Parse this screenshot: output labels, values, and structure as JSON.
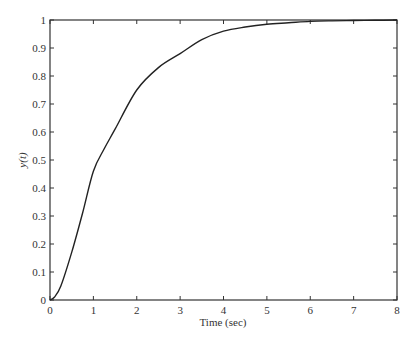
{
  "chart_data": {
    "type": "line",
    "title": "",
    "xlabel": "Time (sec)",
    "ylabel": "y(t)",
    "xlim": [
      0,
      8
    ],
    "ylim": [
      0,
      1
    ],
    "grid": false,
    "legend": null,
    "xticks": [
      "0",
      "1",
      "2",
      "3",
      "4",
      "5",
      "6",
      "7",
      "8"
    ],
    "yticks": [
      "0",
      "0.1",
      "0.2",
      "0.3",
      "0.4",
      "0.5",
      "0.6",
      "0.7",
      "0.8",
      "0.9",
      "1"
    ],
    "series": [
      {
        "name": "y(t)",
        "color": "#222222",
        "x": [
          0,
          0.1,
          0.25,
          0.5,
          0.75,
          1.0,
          1.25,
          1.5,
          2.0,
          2.5,
          3.0,
          3.5,
          4.0,
          4.5,
          5.0,
          5.5,
          6.0,
          6.5,
          7.0,
          7.5,
          8.0
        ],
        "y": [
          0,
          0.01,
          0.05,
          0.17,
          0.31,
          0.46,
          0.54,
          0.61,
          0.75,
          0.83,
          0.88,
          0.93,
          0.96,
          0.975,
          0.985,
          0.99,
          0.995,
          0.997,
          0.998,
          0.999,
          1.0
        ]
      }
    ]
  }
}
